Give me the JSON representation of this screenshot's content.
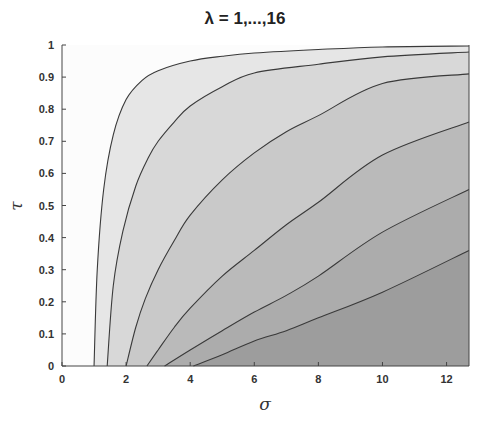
{
  "chart_data": {
    "type": "area",
    "title": "λ = 1,...,16",
    "xlabel": "σ",
    "ylabel": "τ",
    "xlim": [
      0,
      12.7
    ],
    "ylim": [
      0,
      1
    ],
    "xticks": [
      "0",
      "2",
      "4",
      "6",
      "8",
      "10",
      "12"
    ],
    "yticks": [
      "0",
      "0.1",
      "0.2",
      "0.3",
      "0.4",
      "0.5",
      "0.6",
      "0.7",
      "0.8",
      "0.9",
      "1"
    ],
    "grid": false,
    "legend": "none",
    "band_colors": [
      "#f4f4f4",
      "#e6e6e6",
      "#d8d8d8",
      "#c9c9c9",
      "#bababa",
      "#acacac",
      "#9d9d9d"
    ],
    "series": [
      {
        "name": "curve-1",
        "x": [
          0,
          1.0,
          1.1,
          1.3,
          1.6,
          2.0,
          2.5,
          3.0,
          4.0,
          5.0,
          6.0,
          8.0,
          10.0,
          12.7
        ],
        "y": [
          0,
          0,
          0.3,
          0.55,
          0.72,
          0.83,
          0.89,
          0.92,
          0.95,
          0.965,
          0.975,
          0.986,
          0.994,
          0.997
        ]
      },
      {
        "name": "curve-2",
        "x": [
          0,
          1.41,
          1.6,
          1.9,
          2.3,
          2.7,
          3.0,
          3.5,
          4.0,
          5.0,
          6.0,
          8.0,
          10.0,
          12.7
        ],
        "y": [
          0,
          0,
          0.25,
          0.42,
          0.56,
          0.65,
          0.7,
          0.76,
          0.81,
          0.87,
          0.913,
          0.94,
          0.963,
          0.978
        ]
      },
      {
        "name": "curve-3",
        "x": [
          0,
          2.0,
          2.3,
          2.6,
          3.0,
          3.5,
          4.0,
          5.0,
          6.0,
          7.0,
          8.0,
          10.0,
          12.7
        ],
        "y": [
          0,
          0,
          0.12,
          0.21,
          0.3,
          0.39,
          0.47,
          0.58,
          0.664,
          0.73,
          0.78,
          0.88,
          0.91
        ]
      },
      {
        "name": "curve-4",
        "x": [
          0,
          2.65,
          3.0,
          3.5,
          4.0,
          5.0,
          6.0,
          7.0,
          8.0,
          10.0,
          12.7
        ],
        "y": [
          0,
          0,
          0.05,
          0.12,
          0.18,
          0.28,
          0.36,
          0.44,
          0.51,
          0.657,
          0.76
        ]
      },
      {
        "name": "curve-5",
        "x": [
          0,
          3.2,
          4.0,
          5.0,
          6.0,
          7.0,
          8.0,
          10.0,
          12.7
        ],
        "y": [
          0,
          0,
          0.05,
          0.11,
          0.168,
          0.22,
          0.28,
          0.417,
          0.55
        ]
      },
      {
        "name": "curve-6",
        "x": [
          0,
          4.1,
          5.0,
          6.0,
          7.0,
          8.0,
          10.0,
          12.7
        ],
        "y": [
          0,
          0,
          0.035,
          0.078,
          0.11,
          0.15,
          0.23,
          0.36
        ]
      }
    ]
  }
}
